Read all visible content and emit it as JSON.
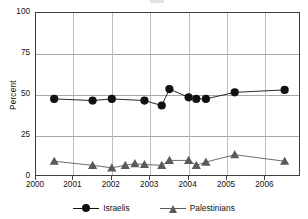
{
  "chart_data": {
    "type": "line",
    "title": "",
    "xlabel": "",
    "ylabel": "Percent",
    "ylim": [
      0,
      100
    ],
    "yticks": [
      0,
      25,
      50,
      75,
      100
    ],
    "xlim": [
      2000,
      2006.9
    ],
    "xticks": [
      2000,
      2001,
      2002,
      2003,
      2004,
      2005,
      2006
    ],
    "xtick_labels": [
      "2000",
      "2001",
      "2002",
      "2003",
      "2004",
      "2005",
      "2006"
    ],
    "grid": "horizontal-and-vertical",
    "legend_position": "bottom-center",
    "series": [
      {
        "name": "Israelis",
        "marker": "circle",
        "color": "#111111",
        "points": [
          {
            "x": 2000.5,
            "y": 47
          },
          {
            "x": 2001.5,
            "y": 46
          },
          {
            "x": 2002.0,
            "y": 47
          },
          {
            "x": 2002.85,
            "y": 46
          },
          {
            "x": 2003.3,
            "y": 43
          },
          {
            "x": 2003.5,
            "y": 53
          },
          {
            "x": 2004.0,
            "y": 48
          },
          {
            "x": 2004.2,
            "y": 47
          },
          {
            "x": 2004.45,
            "y": 47
          },
          {
            "x": 2005.2,
            "y": 51
          },
          {
            "x": 2006.5,
            "y": 52.5
          }
        ]
      },
      {
        "name": "Palestinians",
        "marker": "triangle",
        "color": "#5a5a5a",
        "points": [
          {
            "x": 2000.5,
            "y": 9
          },
          {
            "x": 2001.5,
            "y": 6.5
          },
          {
            "x": 2002.0,
            "y": 5
          },
          {
            "x": 2002.35,
            "y": 6.5
          },
          {
            "x": 2002.6,
            "y": 7.5
          },
          {
            "x": 2002.85,
            "y": 7
          },
          {
            "x": 2003.3,
            "y": 6.5
          },
          {
            "x": 2003.5,
            "y": 9.5
          },
          {
            "x": 2004.0,
            "y": 9.5
          },
          {
            "x": 2004.2,
            "y": 6.5
          },
          {
            "x": 2004.45,
            "y": 8.5
          },
          {
            "x": 2005.2,
            "y": 13
          },
          {
            "x": 2006.5,
            "y": 9
          }
        ]
      }
    ]
  },
  "axis": {
    "y_title": "Percent",
    "y_labels": [
      "100",
      "75",
      "50",
      "25",
      "0"
    ],
    "x_labels": [
      "2000",
      "2001",
      "2002",
      "2003",
      "2004",
      "2005",
      "2006"
    ]
  },
  "legend": {
    "items": [
      {
        "label": "Israelis",
        "marker": "circle",
        "color": "#111111"
      },
      {
        "label": "Palestinians",
        "marker": "triangle",
        "color": "#5a5a5a"
      }
    ]
  }
}
